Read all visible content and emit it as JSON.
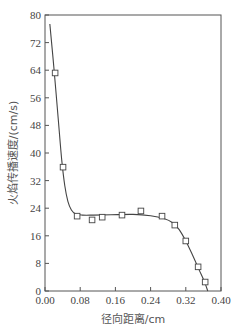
{
  "chart_data": {
    "type": "line",
    "title": "",
    "xlabel": "径向距离/cm",
    "ylabel": "火焰传播速度/(cm/s)",
    "xlim": [
      0.0,
      0.4
    ],
    "ylim": [
      0,
      80
    ],
    "xticks": [
      "0.00",
      "0.08",
      "0.16",
      "0.24",
      "0.32",
      "0.40"
    ],
    "yticks": [
      "0",
      "8",
      "16",
      "24",
      "32",
      "40",
      "48",
      "56",
      "64",
      "72",
      "80"
    ],
    "grid": false,
    "legend": null,
    "series": [
      {
        "name": "measured",
        "style": "open-square-markers",
        "x": [
          0.023,
          0.041,
          0.073,
          0.107,
          0.13,
          0.175,
          0.218,
          0.266,
          0.295,
          0.32,
          0.348,
          0.364
        ],
        "y": [
          63.2,
          35.9,
          21.7,
          20.6,
          21.4,
          22.0,
          23.2,
          21.7,
          19.1,
          14.5,
          7.0,
          2.6
        ]
      },
      {
        "name": "fit",
        "style": "solid-line",
        "x": [
          0.011,
          0.02,
          0.03,
          0.038,
          0.045,
          0.052,
          0.06,
          0.07,
          0.085,
          0.11,
          0.15,
          0.2,
          0.24,
          0.27,
          0.29,
          0.305,
          0.32,
          0.335,
          0.35,
          0.362,
          0.37
        ],
        "y": [
          77.4,
          65.0,
          50.0,
          38.0,
          30.5,
          26.0,
          23.5,
          22.3,
          22.0,
          22.0,
          22.1,
          22.2,
          21.8,
          21.0,
          19.8,
          17.8,
          14.5,
          10.5,
          6.2,
          2.8,
          0.0
        ]
      }
    ]
  },
  "colors": {
    "axis": "#555555",
    "line": "#444444",
    "marker": "#444444"
  }
}
